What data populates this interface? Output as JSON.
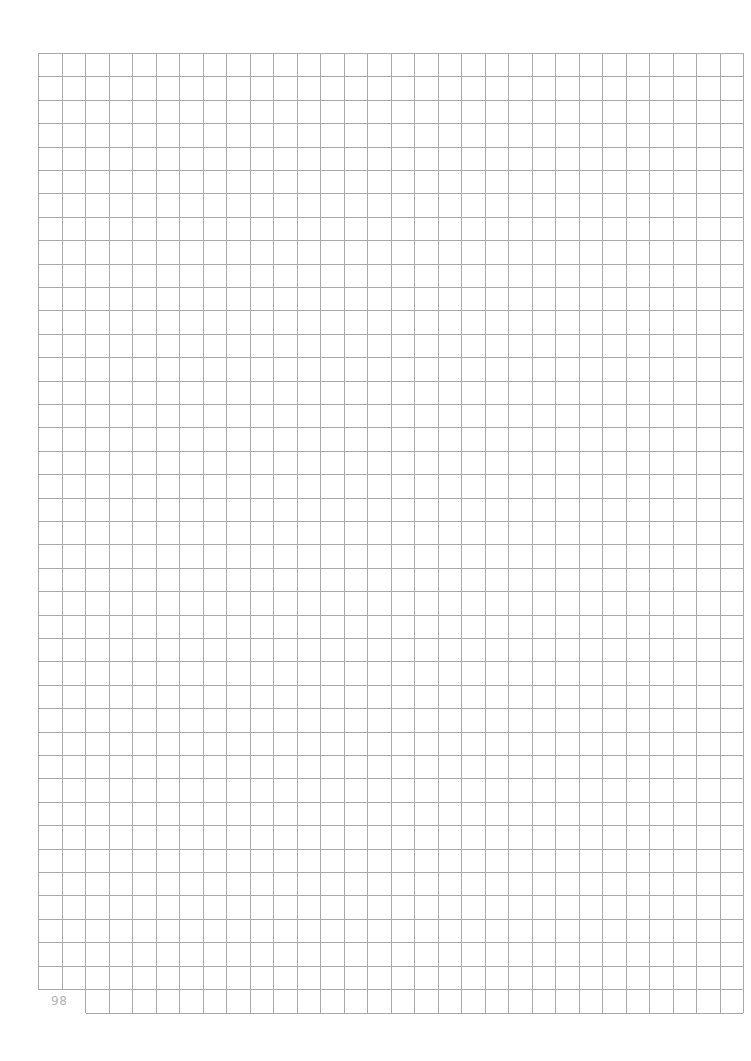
{
  "page": {
    "type": "graph-paper",
    "page_number": "98",
    "grid": {
      "left": 38,
      "top": 53,
      "right": 743,
      "main_bottom": 989,
      "cell_width": 23.5,
      "cell_height": 23.4,
      "columns": 30,
      "rows": 40,
      "extra_row": {
        "from_column": 2,
        "bottom": 1013
      },
      "line_color": "#a9a9a9"
    }
  }
}
